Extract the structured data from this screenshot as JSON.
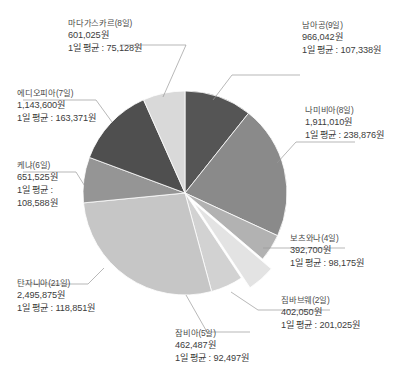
{
  "chart_data": {
    "type": "pie",
    "title": "",
    "subtitle": "",
    "xlabel": "",
    "ylabel": "",
    "legend_position": "callout-labels",
    "grid": false,
    "unit": "원",
    "currency_suffix": "원",
    "daily_average_prefix": "1일 평균 : ",
    "total": 9026314,
    "categories": [
      "남아공(9일)",
      "나미비아(8일)",
      "보츠와나(4일)",
      "짐바브웨(2일)",
      "잠비아(5일)",
      "탄자니아(21일)",
      "케냐(6일)",
      "에디오피아(7일)",
      "마다가스카르(8일)"
    ],
    "values": [
      966042,
      1911010,
      392700,
      402050,
      462487,
      2495875,
      651525,
      1143600,
      601025
    ],
    "slices": [
      {
        "name": "남아공",
        "days": 9,
        "label": "남아공(9일)",
        "total_text": "966,042원",
        "daily_text": "1일 평균 : 107,338원",
        "value": 966042,
        "daily_average": 107338,
        "color": "#555555",
        "percent": 10.7,
        "exploded": false
      },
      {
        "name": "나미비아",
        "days": 8,
        "label": "나미비아(8일)",
        "total_text": "1,911,010원",
        "daily_text": "1일 평균 : 238,876원",
        "value": 1911010,
        "daily_average": 238876,
        "color": "#8a8a8a",
        "percent": 21.2,
        "exploded": false
      },
      {
        "name": "보츠와나",
        "days": 4,
        "label": "보츠와나(4일)",
        "total_text": "392,700원",
        "daily_text": "1일 평균 : 98,175원",
        "value": 392700,
        "daily_average": 98175,
        "color": "#b2b2b2",
        "percent": 4.4,
        "exploded": false
      },
      {
        "name": "짐바브웨",
        "days": 2,
        "label": "짐바브웨(2일)",
        "total_text": "402,050원",
        "daily_text": "1일 평균 : 201,025원",
        "value": 402050,
        "daily_average": 201025,
        "color": "#e3e3e3",
        "percent": 4.5,
        "exploded": true
      },
      {
        "name": "잠비아",
        "days": 5,
        "label": "잠비아(5일)",
        "total_text": "462,487원",
        "daily_text": "1일 평균 : 92,497원",
        "value": 462487,
        "daily_average": 92497,
        "color": "#d2d2d2",
        "percent": 5.1,
        "exploded": false
      },
      {
        "name": "탄자니아",
        "days": 21,
        "label": "탄자니아(21일)",
        "total_text": "2,495,875원",
        "daily_text": "1일 평균 : 118,851원",
        "value": 2495875,
        "daily_average": 118851,
        "color": "#c6c6c6",
        "percent": 27.7,
        "exploded": false
      },
      {
        "name": "케냐",
        "days": 6,
        "label": "케냐(6일)",
        "total_text": "651,525원",
        "daily_text_line1": "1일 평균 :",
        "daily_text_line2": "108,588원",
        "value": 651525,
        "daily_average": 108588,
        "color": "#959595",
        "percent": 7.2,
        "exploded": false
      },
      {
        "name": "에디오피아",
        "days": 7,
        "label": "에디오피아(7일)",
        "total_text": "1,143,600원",
        "daily_text": "1일 평균 : 163,371원",
        "value": 1143600,
        "daily_average": 163371,
        "color": "#4f4f4f",
        "percent": 12.7,
        "exploded": false
      },
      {
        "name": "마다가스카르",
        "days": 8,
        "label": "마다가스카르(8일)",
        "total_text": "601,025원",
        "daily_text": "1일 평균 : 75,128원",
        "value": 601025,
        "daily_average": 75128,
        "color": "#d9d9d9",
        "percent": 6.7,
        "exploded": false
      }
    ]
  }
}
